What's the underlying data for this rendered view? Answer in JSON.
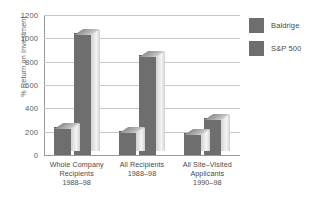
{
  "chart_data": {
    "type": "bar",
    "title": "",
    "subtitle": "",
    "xlabel": "",
    "ylabel": "% Return on Investment",
    "ylim": [
      0,
      1200
    ],
    "yticks": [
      0,
      200,
      400,
      600,
      800,
      1000,
      1200
    ],
    "ytick_labels": [
      "0",
      "200",
      "400",
      "600",
      "800",
      "1000",
      "1200"
    ],
    "grid": true,
    "legend_position": "right",
    "style": "3d-grouped-bar",
    "categories": [
      "Whole Company Recipients 1988–98",
      "All Recipients 1988–98",
      "All Site–Visited Applicants 1990–98"
    ],
    "category_lines": [
      [
        "Whole Company",
        "Recipients",
        "1988–98"
      ],
      [
        "All Recipients",
        "1988–98"
      ],
      [
        "All Site–Visited",
        "Applicants",
        "1990–98"
      ]
    ],
    "series": [
      {
        "name": "Baldrige",
        "color": "#6e6e6e",
        "values": [
          230,
          200,
          180
        ]
      },
      {
        "name": "S&P 500",
        "color": "#6e6e6e",
        "values": [
          1040,
          850,
          310
        ]
      }
    ]
  },
  "legend": {
    "items": [
      {
        "label": "Baldrige",
        "color": "#6e6e6e"
      },
      {
        "label": "S&P 500",
        "color": "#6e6e6e"
      }
    ]
  },
  "axes": {
    "y_title": "% Return on Investment"
  }
}
